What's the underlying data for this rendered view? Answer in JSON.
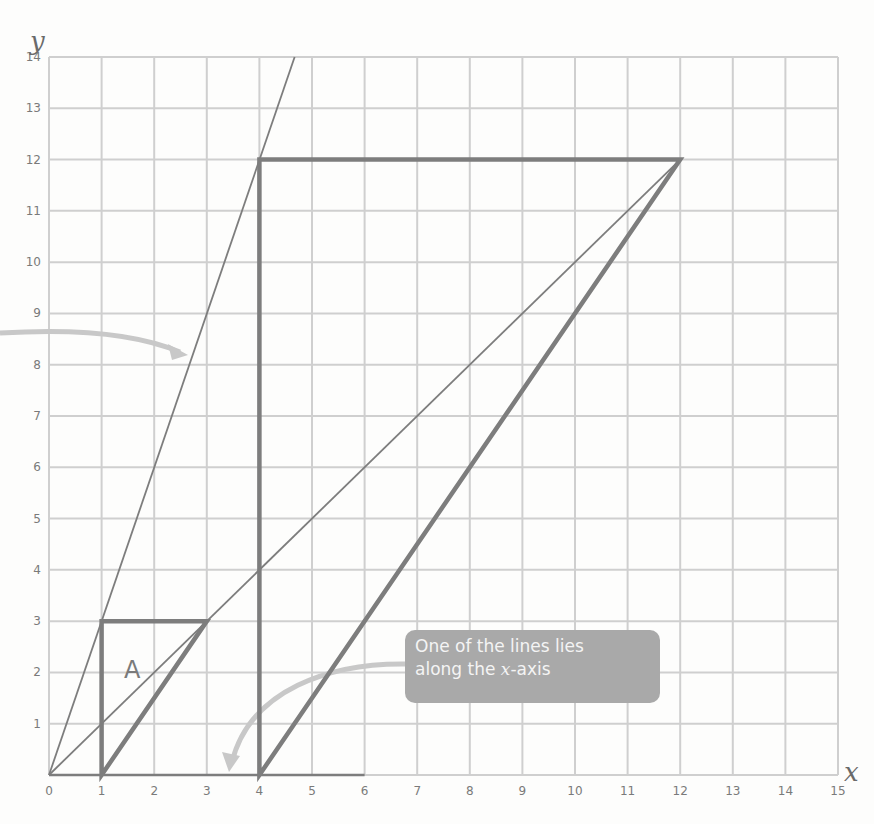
{
  "chart_data": {
    "type": "line",
    "title": "",
    "xlabel": "x",
    "ylabel": "y",
    "xlim": [
      0,
      15
    ],
    "ylim": [
      0,
      14
    ],
    "grid": true,
    "x_ticks": [
      "0",
      "1",
      "2",
      "3",
      "4",
      "5",
      "6",
      "7",
      "8",
      "9",
      "10",
      "11",
      "12",
      "13",
      "14",
      "15"
    ],
    "y_ticks": [
      "1",
      "2",
      "3",
      "4",
      "5",
      "6",
      "7",
      "8",
      "9",
      "10",
      "11",
      "12",
      "13",
      "14"
    ],
    "shapes": [
      {
        "name": "A",
        "type": "polygon",
        "label": "A",
        "vertices": [
          [
            1,
            0
          ],
          [
            1,
            3
          ],
          [
            3,
            3
          ]
        ]
      },
      {
        "name": "Enlargement",
        "type": "polygon",
        "vertices": [
          [
            4,
            0
          ],
          [
            4,
            12
          ],
          [
            12,
            12
          ]
        ]
      }
    ],
    "lines": [
      {
        "name": "ray through (1,3)",
        "from": [
          0,
          0
        ],
        "to": [
          4.67,
          14
        ]
      },
      {
        "name": "ray through (3,3) and (12,12)",
        "from": [
          0,
          0
        ],
        "to": [
          12,
          12
        ]
      },
      {
        "name": "x-axis segment",
        "from": [
          0,
          0
        ],
        "to": [
          6,
          0
        ]
      }
    ],
    "annotations": [
      {
        "text": "One of the lines lies along the x-axis",
        "points_to": [
          3.4,
          0.1
        ]
      }
    ]
  },
  "callout": {
    "line1": "One of the lines lies",
    "line2_prefix": "along the ",
    "line2_var": "x",
    "line2_suffix": "-axis"
  },
  "labels": {
    "x_axis": "x",
    "y_axis": "y",
    "shape_a": "A"
  }
}
